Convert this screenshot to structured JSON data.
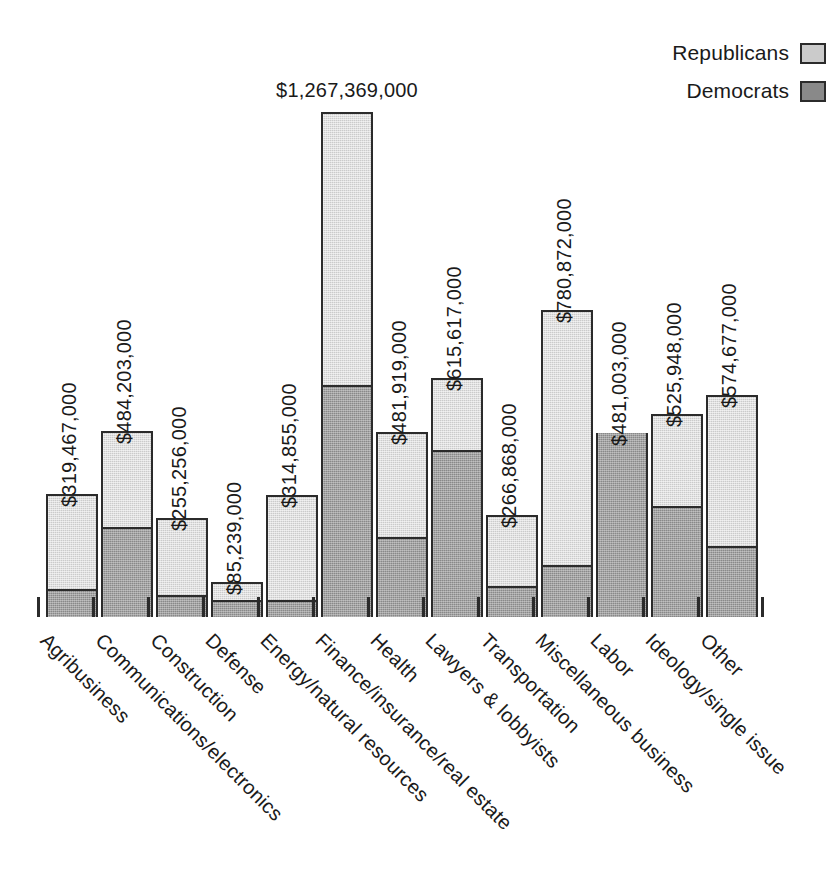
{
  "legend": {
    "items": [
      {
        "label": "Republicans",
        "color": "#cbcbcb",
        "swatch_name": "republicans-swatch"
      },
      {
        "label": "Democrats",
        "color": "#898989",
        "swatch_name": "democrats-swatch"
      }
    ]
  },
  "chart_data": {
    "type": "bar",
    "subtype": "stacked-vertical",
    "title": "",
    "subtitle": "",
    "xlabel": "",
    "ylabel": "",
    "grid": false,
    "axis_line": false,
    "y_axis_ticks_visible": false,
    "x_tick_marks": true,
    "legend_position": "top-right",
    "value_label_format": "$#,###,###,000",
    "value_label_rotation_deg": -90,
    "category_label_rotation_deg": -45,
    "units": "US dollars",
    "ylim": [
      0,
      1267369000
    ],
    "categories": [
      "Agribusiness",
      "Communications/electronics",
      "Construction",
      "Defense",
      "Energy/natural resources",
      "Finance/insurance/real estate",
      "Health",
      "Lawyers & lobbyists",
      "Transportation",
      "Miscellaneous business",
      "Labor",
      "Ideology/single issue",
      "Other"
    ],
    "totals": [
      319467000,
      484203000,
      255256000,
      85239000,
      314855000,
      1267369000,
      481919000,
      615617000,
      266868000,
      780872000,
      481003000,
      525948000,
      574677000
    ],
    "total_labels": [
      "$319,467,000",
      "$484,203,000",
      "$255,256,000",
      "$85,239,000",
      "$314,855,000",
      "$1,267,369,000",
      "$481,919,000",
      "$615,617,000",
      "$266,868,000",
      "$780,872,000",
      "$481,003,000",
      "$525,948,000",
      "$574,677,000"
    ],
    "series": [
      {
        "name": "Republicans",
        "color": "#cbcbcb",
        "values": [
          249300000,
          251100000,
          200400000,
          42800000,
          271500000,
          685300000,
          274000000,
          185400000,
          186500000,
          647500000,
          0,
          238000000,
          391600000
        ]
      },
      {
        "name": "Democrats",
        "color": "#898989",
        "values": [
          70200000,
          233100000,
          54900000,
          42400000,
          43400000,
          582100000,
          207900000,
          430200000,
          80400000,
          133400000,
          481003000,
          287900000,
          183100000
        ]
      }
    ]
  },
  "bars": [
    {
      "category": "Agribusiness",
      "label": "$319,467,000",
      "x": 46,
      "total_px": 123,
      "dem_px": 28,
      "label_flat": false
    },
    {
      "category": "Communications/electronics",
      "label": "$484,203,000",
      "x": 101,
      "total_px": 186,
      "dem_px": 90,
      "label_flat": false
    },
    {
      "category": "Construction",
      "label": "$255,256,000",
      "x": 156,
      "total_px": 99,
      "dem_px": 22,
      "label_flat": false
    },
    {
      "category": "Defense",
      "label": "$85,239,000",
      "x": 211,
      "total_px": 35,
      "dem_px": 17,
      "label_flat": false
    },
    {
      "category": "Energy/natural resources",
      "label": "$314,855,000",
      "x": 266,
      "total_px": 122,
      "dem_px": 17,
      "label_flat": false
    },
    {
      "category": "Finance/insurance/real estate",
      "label": "$1,267,369,000",
      "x": 321,
      "total_px": 505,
      "dem_px": 232,
      "label_flat": true
    },
    {
      "category": "Health",
      "label": "$481,919,000",
      "x": 376,
      "total_px": 185,
      "dem_px": 80,
      "label_flat": false
    },
    {
      "category": "Lawyers & lobbyists",
      "label": "$615,617,000",
      "x": 431,
      "total_px": 239,
      "dem_px": 167,
      "label_flat": false
    },
    {
      "category": "Transportation",
      "label": "$266,868,000",
      "x": 486,
      "total_px": 102,
      "dem_px": 31,
      "label_flat": false
    },
    {
      "category": "Miscellaneous business",
      "label": "$780,872,000",
      "x": 541,
      "total_px": 307,
      "dem_px": 52,
      "label_flat": false
    },
    {
      "category": "Labor",
      "label": "$481,003,000",
      "x": 596,
      "total_px": 184,
      "dem_px": 184,
      "label_flat": false
    },
    {
      "category": "Ideology/single issue",
      "label": "$525,948,000",
      "x": 651,
      "total_px": 203,
      "dem_px": 111,
      "label_flat": false
    },
    {
      "category": "Other",
      "label": "$574,677,000",
      "x": 706,
      "total_px": 222,
      "dem_px": 71,
      "label_flat": false
    }
  ],
  "geometry": {
    "baseline_y": 617,
    "bar_width": 52,
    "tick_height": 20,
    "tick_offset_left": 9,
    "value_label_gap": 10,
    "cat_label_gap": 12,
    "last_tick_x": 761
  }
}
